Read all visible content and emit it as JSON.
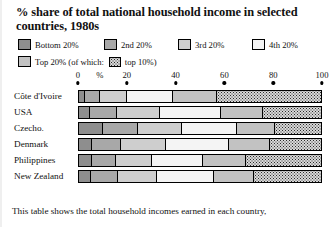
{
  "title": "% share of total national household income in selected countries, 1980s",
  "legend": {
    "row1": [
      {
        "label": "Bottom 20%",
        "swatch": "bottom-20-swatch",
        "color": "#8e8e8e"
      },
      {
        "label": "2nd 20%",
        "swatch": "2nd-20-swatch",
        "color": "#a8a8a8"
      },
      {
        "label": "3rd 20%",
        "swatch": "3rd-20-swatch",
        "color": "#cecece"
      },
      {
        "label": "4th 20%",
        "swatch": "4th-20-swatch",
        "color": "#f4f4f4"
      }
    ],
    "row2": [
      {
        "label": "Top 20% (of which:",
        "swatch": "top-20-swatch",
        "color": "#c2c2c2"
      },
      {
        "label": "top 10%)",
        "swatch": "top-10-swatch",
        "color": "#d8d8d8"
      }
    ]
  },
  "footer": {
    "line1": "This table shows the total household incomes earned in each country,"
  },
  "chart_data": {
    "type": "bar",
    "orientation": "horizontal",
    "stacked": true,
    "title": "% share of total national household income in selected countries, 1980s",
    "xlabel": "%",
    "ylabel": "",
    "xlim": [
      0,
      100
    ],
    "ticks": [
      0,
      20,
      40,
      60,
      80,
      100
    ],
    "tick_labels": [
      "0",
      "20",
      "40",
      "60",
      "80",
      "100"
    ],
    "percent_marker": "%",
    "grid": false,
    "legend_position": "top",
    "categories": [
      "Côte d'Ivoire",
      "USA",
      "Czecho.",
      "Denmark",
      "Philippines",
      "New Zealand"
    ],
    "series": [
      {
        "name": "Bottom 20%",
        "color": "#8e8e8e",
        "values": [
          2.4,
          4.7,
          9.9,
          5.4,
          5.5,
          5.1
        ]
      },
      {
        "name": "2nd 20%",
        "color": "#a8a8a8",
        "values": [
          6.2,
          11.0,
          14.3,
          12.0,
          9.7,
          10.8
        ]
      },
      {
        "name": "3rd 20%",
        "color": "#cecece",
        "values": [
          10.9,
          17.4,
          18.0,
          18.4,
          14.8,
          16.2
        ]
      },
      {
        "name": "4th 20%",
        "color": "#f4f4f4",
        "values": [
          19.1,
          25.0,
          22.6,
          25.6,
          21.0,
          23.2
        ]
      },
      {
        "name": "Top 20%",
        "color": "#c2c2c2",
        "values": [
          61.4,
          41.9,
          35.2,
          38.6,
          49.0,
          44.7
        ]
      }
    ],
    "top_10_of_top_20": {
      "name": "top 10%",
      "pattern": "dotted",
      "color": "#d8d8d8",
      "values": [
        43.7,
        25.0,
        20.0,
        22.3,
        32.1,
        28.7
      ]
    }
  }
}
